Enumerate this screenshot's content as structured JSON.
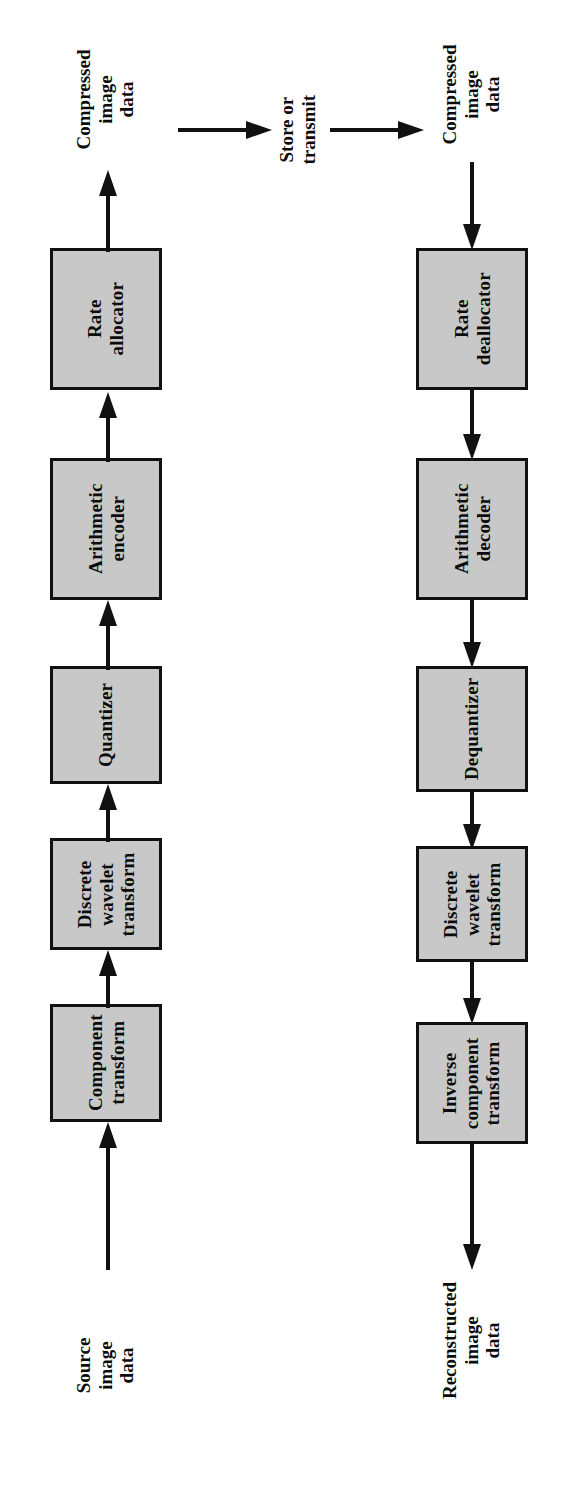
{
  "figure": {
    "type": "block-diagram",
    "orientation": "rotated-90-ccw",
    "colors": {
      "box_fill": "#c8c8c8",
      "box_border": "#111111",
      "text": "#0b0b0b",
      "arrow": "#111111",
      "background": "#ffffff"
    }
  },
  "encoder": {
    "name": "Encoder pipeline",
    "input_label": "Source\nimage\ndata",
    "output_label": "Compressed\nimage\ndata",
    "blocks": [
      {
        "id": "component-transform",
        "label": "Component\ntransform"
      },
      {
        "id": "discrete-wavelet-transform",
        "label": "Discrete\nwavelet\ntransform"
      },
      {
        "id": "quantizer",
        "label": "Quantizer"
      },
      {
        "id": "arithmetic-encoder",
        "label": "Arithmetic\nencoder"
      },
      {
        "id": "rate-allocator",
        "label": "Rate\nallocator"
      }
    ]
  },
  "channel": {
    "label": "Store or\ntransmit",
    "arrow_in": "arrow-right-icon",
    "arrow_out": "arrow-right-icon"
  },
  "decoder": {
    "name": "Decoder pipeline",
    "input_label": "Compressed\nimage\ndata",
    "output_label": "Reconstructed\nimage\ndata",
    "blocks": [
      {
        "id": "rate-deallocator",
        "label": "Rate\ndeallocator"
      },
      {
        "id": "arithmetic-decoder",
        "label": "Arithmetic\ndecoder"
      },
      {
        "id": "dequantizer",
        "label": "Dequantizer"
      },
      {
        "id": "discrete-wavelet-transform-inv",
        "label": "Discrete\nwavelet\ntransform"
      },
      {
        "id": "inverse-component-transform",
        "label": "Inverse\ncomponent\ntransform"
      }
    ]
  }
}
